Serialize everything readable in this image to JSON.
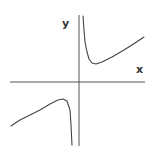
{
  "chart_data": {
    "type": "line",
    "title": "",
    "xlabel": "x",
    "ylabel": "y",
    "grid": false,
    "legend": null,
    "series": [
      {
        "name": "right-branch",
        "points_px": [
          [
            83,
            16
          ],
          [
            84,
            30
          ],
          [
            85,
            42
          ],
          [
            87,
            52
          ],
          [
            89,
            59
          ],
          [
            92,
            63
          ],
          [
            96,
            64
          ],
          [
            102,
            62
          ],
          [
            112,
            57
          ],
          [
            124,
            50
          ],
          [
            135,
            43
          ],
          [
            144,
            37
          ]
        ]
      },
      {
        "name": "left-branch",
        "points_px": [
          [
            11,
            126
          ],
          [
            20,
            120
          ],
          [
            30,
            115
          ],
          [
            40,
            110
          ],
          [
            50,
            104
          ],
          [
            58,
            100
          ],
          [
            63,
            99
          ],
          [
            67,
            101
          ],
          [
            70,
            110
          ],
          [
            71,
            125
          ],
          [
            72,
            145
          ]
        ]
      }
    ],
    "axes": {
      "x_axis_px": {
        "x1": 10,
        "x2": 145,
        "y": 82
      },
      "y_axis_px": {
        "x": 79,
        "y1": 15,
        "y2": 146
      }
    }
  },
  "labels": {
    "x": "x",
    "y": "y"
  },
  "colors": {
    "axis": "#555555",
    "curve": "#444444",
    "background": "#ffffff"
  }
}
